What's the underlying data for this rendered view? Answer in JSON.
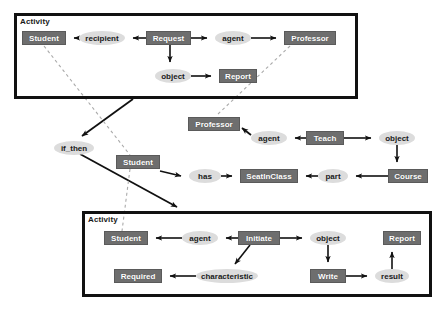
{
  "diagram": {
    "title_fragment": "",
    "boxes": [
      {
        "id": "activity-top",
        "label": "Activity",
        "x": 14,
        "y": 13,
        "w": 344,
        "h": 86
      },
      {
        "id": "activity-bottom",
        "label": "Activity",
        "x": 82,
        "y": 211,
        "w": 350,
        "h": 86
      }
    ],
    "class_nodes": [
      {
        "id": "student-top",
        "label": "Student",
        "x": 22,
        "y": 31,
        "w": 44,
        "h": 14
      },
      {
        "id": "request",
        "label": "Request",
        "x": 146,
        "y": 31,
        "w": 45,
        "h": 14
      },
      {
        "id": "professor-top",
        "label": "Professor",
        "x": 284,
        "y": 31,
        "w": 52,
        "h": 14
      },
      {
        "id": "report-top",
        "label": "Report",
        "x": 219,
        "y": 69,
        "w": 38,
        "h": 14
      },
      {
        "id": "professor-mid",
        "label": "Professor",
        "x": 188,
        "y": 117,
        "w": 52,
        "h": 14
      },
      {
        "id": "teach",
        "label": "Teach",
        "x": 306,
        "y": 131,
        "w": 38,
        "h": 14
      },
      {
        "id": "student-mid",
        "label": "Student",
        "x": 116,
        "y": 155,
        "w": 44,
        "h": 14
      },
      {
        "id": "seatinclass",
        "label": "SeatInClass",
        "x": 240,
        "y": 169,
        "w": 58,
        "h": 14
      },
      {
        "id": "course",
        "label": "Course",
        "x": 388,
        "y": 169,
        "w": 40,
        "h": 14
      },
      {
        "id": "student-bot",
        "label": "Student",
        "x": 104,
        "y": 231,
        "w": 44,
        "h": 14
      },
      {
        "id": "initiate",
        "label": "Initiate",
        "x": 238,
        "y": 231,
        "w": 42,
        "h": 14
      },
      {
        "id": "report-bot",
        "label": "Report",
        "x": 383,
        "y": 231,
        "w": 38,
        "h": 14
      },
      {
        "id": "required",
        "label": "Required",
        "x": 114,
        "y": 269,
        "w": 48,
        "h": 14
      },
      {
        "id": "write",
        "label": "Write",
        "x": 310,
        "y": 269,
        "w": 36,
        "h": 14
      }
    ],
    "relation_nodes": [
      {
        "id": "recipient-top",
        "label": "recipient",
        "x": 79,
        "y": 31,
        "w": 46,
        "h": 14
      },
      {
        "id": "agent-top",
        "label": "agent",
        "x": 215,
        "y": 31,
        "w": 36,
        "h": 14
      },
      {
        "id": "object-top",
        "label": "object",
        "x": 155,
        "y": 69,
        "w": 36,
        "h": 14
      },
      {
        "id": "if-then",
        "label": "if_then",
        "x": 54,
        "y": 141,
        "w": 40,
        "h": 14
      },
      {
        "id": "agent-mid",
        "label": "agent",
        "x": 251,
        "y": 131,
        "w": 36,
        "h": 14
      },
      {
        "id": "object-mid",
        "label": "object",
        "x": 379,
        "y": 131,
        "w": 36,
        "h": 14
      },
      {
        "id": "has",
        "label": "has",
        "x": 189,
        "y": 169,
        "w": 32,
        "h": 14
      },
      {
        "id": "part",
        "label": "part",
        "x": 318,
        "y": 169,
        "w": 30,
        "h": 14
      },
      {
        "id": "agent-bot",
        "label": "agent",
        "x": 182,
        "y": 231,
        "w": 36,
        "h": 14
      },
      {
        "id": "object-bot",
        "label": "object",
        "x": 310,
        "y": 231,
        "w": 36,
        "h": 14
      },
      {
        "id": "characteristic",
        "label": "characteristic",
        "x": 196,
        "y": 269,
        "w": 62,
        "h": 14
      },
      {
        "id": "result",
        "label": "result",
        "x": 375,
        "y": 269,
        "w": 34,
        "h": 14
      }
    ],
    "edges": [
      {
        "from": "request",
        "to": "recipient-top",
        "kind": "arrow"
      },
      {
        "from": "recipient-top",
        "to": "student-top",
        "kind": "arrow"
      },
      {
        "from": "request",
        "to": "agent-top",
        "kind": "arrow"
      },
      {
        "from": "agent-top",
        "to": "professor-top",
        "kind": "arrow"
      },
      {
        "from": "request",
        "to": "object-top",
        "kind": "arrow"
      },
      {
        "from": "object-top",
        "to": "report-top",
        "kind": "arrow"
      },
      {
        "from": "teach",
        "to": "agent-mid",
        "kind": "arrow"
      },
      {
        "from": "agent-mid",
        "to": "professor-mid",
        "kind": "arrow"
      },
      {
        "from": "teach",
        "to": "object-mid",
        "kind": "arrow"
      },
      {
        "from": "object-mid",
        "to": "course",
        "kind": "arrow"
      },
      {
        "from": "course",
        "to": "part",
        "kind": "arrow"
      },
      {
        "from": "part",
        "to": "seatinclass",
        "kind": "arrow"
      },
      {
        "from": "student-mid",
        "to": "has",
        "kind": "arrow"
      },
      {
        "from": "has",
        "to": "seatinclass",
        "kind": "arrow"
      },
      {
        "from": "activity-top",
        "to": "if-then",
        "kind": "arrow"
      },
      {
        "from": "if-then",
        "to": "activity-bottom",
        "kind": "arrow"
      },
      {
        "from": "initiate",
        "to": "agent-bot",
        "kind": "arrow"
      },
      {
        "from": "agent-bot",
        "to": "student-bot",
        "kind": "arrow"
      },
      {
        "from": "initiate",
        "to": "object-bot",
        "kind": "arrow"
      },
      {
        "from": "object-bot",
        "to": "write",
        "kind": "arrow"
      },
      {
        "from": "initiate",
        "to": "characteristic",
        "kind": "arrow"
      },
      {
        "from": "characteristic",
        "to": "required",
        "kind": "arrow"
      },
      {
        "from": "write",
        "to": "result",
        "kind": "arrow"
      },
      {
        "from": "result",
        "to": "report-bot",
        "kind": "arrow"
      },
      {
        "from": "student-top",
        "to": "student-mid",
        "kind": "dashed"
      },
      {
        "from": "student-mid",
        "to": "student-bot",
        "kind": "dashed"
      },
      {
        "from": "professor-top",
        "to": "professor-mid",
        "kind": "dashed"
      }
    ],
    "colors": {
      "class_fill": "#6e6e6e",
      "class_text": "#ffffff",
      "relation_fill": "#dcdcdc",
      "relation_text": "#1a1a1a",
      "edge": "#111111",
      "dashed_edge": "#a9a9a9",
      "box_border": "#111111",
      "background": "#ffffff"
    }
  }
}
